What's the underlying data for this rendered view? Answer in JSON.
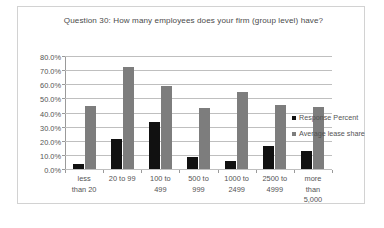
{
  "chart_data": {
    "type": "bar",
    "title": "Question 30: How many employees does your firm (group level) have?",
    "xlabel": "",
    "ylabel": "",
    "ylim": [
      0,
      80
    ],
    "ytick_labels": [
      "80.0%",
      "70.0%",
      "60.0%",
      "50.0%",
      "40.0%",
      "30.0%",
      "20.0%",
      "10.0%",
      "0.0%"
    ],
    "ytick_values": [
      80,
      70,
      60,
      50,
      40,
      30,
      20,
      10,
      0
    ],
    "grid": true,
    "legend_position": "right",
    "categories": [
      "less\nthan 20",
      "20 to 99",
      "100 to\n499",
      "500 to\n999",
      "1000 to\n2499",
      "2500 to\n4999",
      "more\nthan\n5,000"
    ],
    "series": [
      {
        "name": "Response Percent",
        "color": "#111111",
        "values": [
          3.5,
          21.5,
          33.5,
          8.5,
          6.0,
          16.0,
          12.5
        ]
      },
      {
        "name": "Average lease share",
        "color": "#7d7d7d",
        "values": [
          44.5,
          72.0,
          59.0,
          43.5,
          54.5,
          45.0,
          44.0
        ]
      }
    ]
  }
}
